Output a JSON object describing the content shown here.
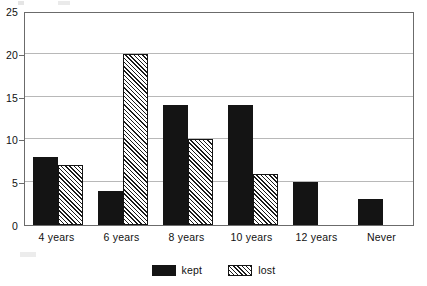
{
  "chart_data": {
    "type": "bar",
    "title": "",
    "subtitle": "",
    "xlabel": "",
    "ylabel": "",
    "categories": [
      "4 years",
      "6 years",
      "8 years",
      "10 years",
      "12 years",
      "Never"
    ],
    "series": [
      {
        "name": "kept",
        "values": [
          8,
          4,
          14,
          14,
          5,
          3
        ],
        "fill": "solid-black",
        "color": "#141414"
      },
      {
        "name": "lost",
        "values": [
          7,
          20,
          10,
          6,
          0,
          0
        ],
        "fill": "diagonal-hatch",
        "color": "#1b1b1b"
      }
    ],
    "ylim": [
      0,
      25
    ],
    "ytick_values": [
      0,
      5,
      10,
      15,
      20,
      25
    ],
    "ytick_labels": [
      "0",
      "5",
      "10",
      "15",
      "20",
      "25"
    ],
    "grid": true,
    "grid_axis": "y",
    "legend_position": "bottom-center",
    "legend_entries": [
      "kept",
      "lost"
    ],
    "frame": true,
    "annotations": []
  }
}
